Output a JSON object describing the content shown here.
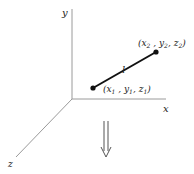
{
  "diagram": {
    "axes": {
      "x_label": "x",
      "y_label": "y",
      "z_label": "z"
    },
    "segment": {
      "label": "l"
    },
    "point1": {
      "x": "x",
      "x_sub": "1",
      "y": "y",
      "y_sub": "1",
      "z": "z",
      "z_sub": "1"
    },
    "point2": {
      "x": "x",
      "x_sub": "2",
      "y": "y",
      "y_sub": "2",
      "z": "z",
      "z_sub": "2"
    },
    "colors": {
      "axis": "#999999",
      "segment": "#111111",
      "text": "#222222"
    }
  }
}
